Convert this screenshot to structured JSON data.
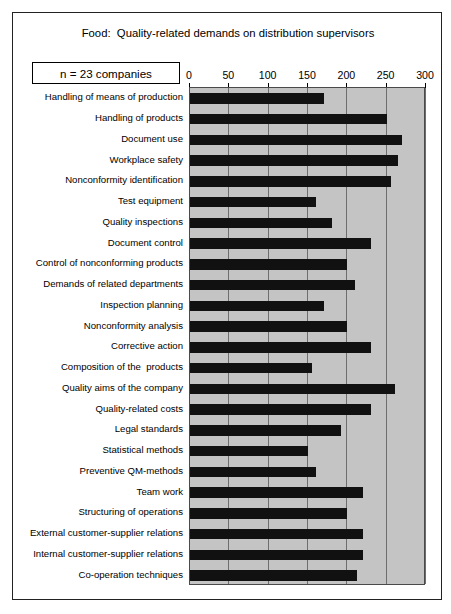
{
  "figure": {
    "title": "Food:  Quality-related demands on distribution supervisors",
    "annotation": "n = 23 companies"
  },
  "chart_data": {
    "type": "bar",
    "orientation": "horizontal",
    "title": "Food:  Quality-related demands on distribution supervisors",
    "xlabel": "",
    "ylabel": "",
    "xlim": [
      0,
      300
    ],
    "xticks": [
      0,
      50,
      100,
      150,
      200,
      250,
      300
    ],
    "tick_labels": [
      "0",
      "50",
      "100",
      "150",
      "200",
      "250",
      "300"
    ],
    "grid": true,
    "legend": false,
    "annotations": [
      "n = 23 companies"
    ],
    "bar_color": "#111111",
    "plot_background": "#c4c4c4",
    "categories": [
      "Handling of means of production",
      "Handling of products",
      "Document use",
      "Workplace safety",
      "Nonconformity identification",
      "Test equipment",
      "Quality inspections",
      "Document control",
      "Control of nonconforming products",
      "Demands of related departments",
      "Inspection planning",
      "Nonconformity analysis",
      "Corrective action",
      "Composition of the  products",
      "Quality aims of the company",
      "Quality-related costs",
      "Legal standards",
      "Statistical methods",
      "Preventive QM-methods",
      "Team work",
      "Structuring of operations",
      "External customer-supplier relations",
      "Internal customer-supplier relations",
      "Co-operation techniques"
    ],
    "values": [
      170,
      250,
      270,
      265,
      255,
      160,
      180,
      230,
      200,
      210,
      170,
      200,
      230,
      155,
      260,
      230,
      192,
      150,
      160,
      220,
      200,
      220,
      220,
      212
    ]
  }
}
